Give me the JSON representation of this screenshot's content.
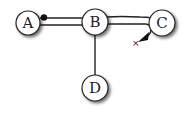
{
  "diagram": {
    "nodes": [
      {
        "id": "A",
        "label": "A",
        "cx": 28,
        "cy": 23,
        "r": 12
      },
      {
        "id": "B",
        "label": "B",
        "cx": 95,
        "cy": 22,
        "r": 13
      },
      {
        "id": "C",
        "label": "C",
        "cx": 162,
        "cy": 23,
        "r": 13
      },
      {
        "id": "D",
        "label": "D",
        "cx": 95,
        "cy": 88,
        "r": 13
      }
    ],
    "edges": [
      {
        "from": "A",
        "to": "B",
        "style": "double",
        "start_marker": "dot"
      },
      {
        "from": "B",
        "to": "C",
        "style": "double",
        "end_marker": "arrow-to-x"
      },
      {
        "from": "B",
        "to": "D",
        "style": "single"
      }
    ],
    "marker_x": {
      "label": "×",
      "x": 134,
      "y": 43
    },
    "colors": {
      "stroke": "#222222",
      "fill": "#ffffff",
      "shadow": "#888888"
    }
  }
}
